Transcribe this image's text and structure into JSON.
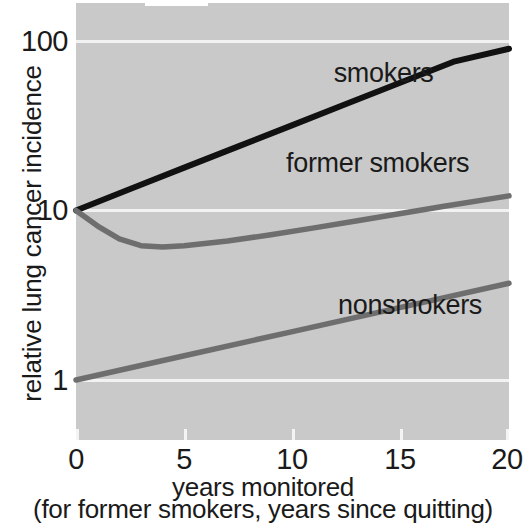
{
  "chart_data": {
    "type": "line",
    "title": "",
    "xlabel": "years monitored",
    "xlabel_note": "(for former smokers, years since quitting)",
    "ylabel": "relative lung cancer incidence",
    "yscale": "log",
    "xlim": [
      0,
      20
    ],
    "ylim": [
      0.7,
      170
    ],
    "grid": true,
    "gridlines_y": [
      1,
      10,
      100
    ],
    "xticks": [
      0,
      5,
      10,
      15,
      20
    ],
    "xticklabels": [
      "0",
      "5",
      "10",
      "15",
      "20"
    ],
    "yticks": [
      1,
      10,
      100
    ],
    "yticklabels": [
      "1",
      "10",
      "100"
    ],
    "legend_position": "inline-annotations",
    "plot_background": "#c9c9c9",
    "series": [
      {
        "name": "smokers",
        "color": "#111111",
        "label_x": 11.9,
        "label_y": 63,
        "x": [
          0,
          2.5,
          5,
          7.5,
          10,
          12.5,
          15,
          17.5,
          20
        ],
        "values": [
          10,
          13.4,
          17.9,
          23.9,
          31.9,
          42.6,
          56.9,
          75.9,
          90
        ]
      },
      {
        "name": "former smokers",
        "color": "#6e6e6e",
        "label_x": 9.7,
        "label_y": 18.5,
        "x": [
          0,
          1,
          2,
          3,
          4,
          5,
          7,
          9,
          11,
          13,
          15,
          17,
          20
        ],
        "values": [
          10,
          8.1,
          6.8,
          6.2,
          6.1,
          6.2,
          6.6,
          7.2,
          7.9,
          8.7,
          9.6,
          10.6,
          12.2
        ]
      },
      {
        "name": "nonsmokers",
        "color": "#6e6e6e",
        "label_x": 12.1,
        "label_y": 2.7,
        "x": [
          0,
          5,
          10,
          15,
          20
        ],
        "values": [
          1,
          1.39,
          1.93,
          2.68,
          3.72
        ]
      }
    ]
  },
  "axis": {
    "y_tick_labels": [
      "100",
      "10",
      "1"
    ],
    "x_tick_labels": [
      "0",
      "5",
      "10",
      "15",
      "20"
    ],
    "y_title": "relative lung cancer incidence",
    "x_title_line1": "years monitored",
    "x_title_line2": "(for former smokers, years since quitting)"
  },
  "annotations": {
    "smokers": "smokers",
    "former_smokers": "former smokers",
    "nonsmokers": "nonsmokers"
  }
}
